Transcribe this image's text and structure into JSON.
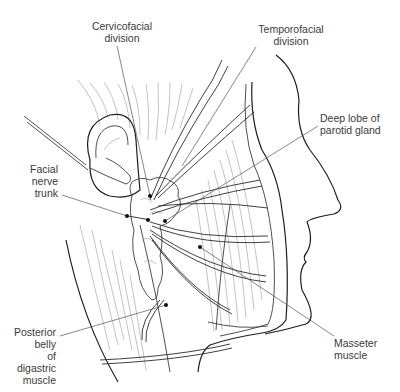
{
  "figure": {
    "type": "anatomical line illustration",
    "colors": {
      "line": "#1e1e1e",
      "hatching": "#9a9a9a",
      "label_text": "#3a3a3a",
      "background": "#ffffff"
    }
  },
  "labels": {
    "cervicofacial": "Cervicofacial\ndivision",
    "temporofacial": "Temporofacial\ndivision",
    "deep_lobe": "Deep lobe of\nparotid gland",
    "facial_nerve_trunk": "Facial\nnerve\ntrunk",
    "posterior_belly": "Posterior\nbelly\nof\ndigastric\nmuscle",
    "masseter": "Masseter\nmuscle"
  },
  "pointers": [
    {
      "label": "Cervicofacial division",
      "from": [
        117,
        46
      ],
      "to": [
        150,
        196
      ]
    },
    {
      "label": "Temporofacial division",
      "from": [
        256,
        47
      ],
      "to": [
        182,
        166
      ]
    },
    {
      "label": "Deep lobe of parotid gland",
      "from": [
        318,
        126
      ],
      "to": [
        165,
        221
      ]
    },
    {
      "label": "Facial nerve trunk",
      "from": [
        62,
        195
      ],
      "to": [
        127,
        216
      ]
    },
    {
      "label": "Posterior belly of digastric muscle",
      "from": [
        60,
        336
      ],
      "to": [
        166,
        305
      ]
    },
    {
      "label": "Masseter muscle",
      "from": [
        334,
        336
      ],
      "to": [
        200,
        247
      ]
    }
  ]
}
